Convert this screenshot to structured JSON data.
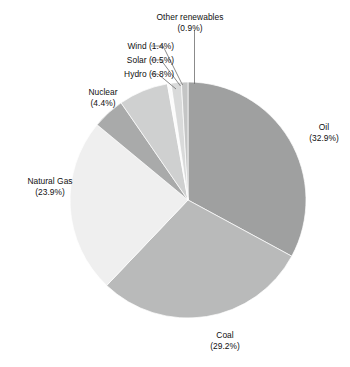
{
  "chart_data": {
    "type": "pie",
    "title": "",
    "subtitle": "",
    "xlabel": "",
    "ylabel": "",
    "legend_position": "none",
    "grid": false,
    "units": "percent",
    "total": 100.0,
    "start_angle_deg": 0,
    "direction": "clockwise",
    "categories": [
      "Oil",
      "Coal",
      "Natural Gas",
      "Nuclear",
      "Hydro",
      "Solar",
      "Wind",
      "Other renewables"
    ],
    "values": [
      32.9,
      29.2,
      23.9,
      4.4,
      6.8,
      0.5,
      1.4,
      0.9
    ],
    "colors": [
      "#9fa0a0",
      "#b9baba",
      "#efefef",
      "#a9aaaa",
      "#cfd0d0",
      "#fbfbfb",
      "#d9dada",
      "#c4c5c5"
    ],
    "slices": [
      {
        "label": "Oil",
        "value": 32.9,
        "value_text": "(32.9%)",
        "color": "#9fa0a0"
      },
      {
        "label": "Coal",
        "value": 29.2,
        "value_text": "(29.2%)",
        "color": "#b9baba"
      },
      {
        "label": "Natural Gas",
        "value": 23.9,
        "value_text": "(23.9%)",
        "color": "#efefef"
      },
      {
        "label": "Nuclear",
        "value": 4.4,
        "value_text": "(4.4%)",
        "color": "#a9aaaa"
      },
      {
        "label": "Hydro",
        "value": 6.8,
        "value_text": "(6.8%)",
        "color": "#cfd0d0"
      },
      {
        "label": "Solar",
        "value": 0.5,
        "value_text": "(0.5%)",
        "color": "#fbfbfb"
      },
      {
        "label": "Wind",
        "value": 1.4,
        "value_text": "(1.4%)",
        "color": "#d9dada"
      },
      {
        "label": "Other renewables",
        "value": 0.9,
        "value_text": "(0.9%)",
        "color": "#c4c5c5"
      }
    ]
  },
  "labels": {
    "other_renewables": {
      "line1": "Other renewables",
      "line2": "(0.9%)"
    },
    "wind": {
      "line1": "Wind (1.4%)"
    },
    "solar": {
      "line1": "Solar (0.5%)"
    },
    "hydro": {
      "line1": "Hydro (6.8%)"
    },
    "nuclear": {
      "line1": "Nuclear",
      "line2": "(4.4%)"
    },
    "natural_gas": {
      "line1": "Natural Gas",
      "line2": "(23.9%)"
    },
    "oil": {
      "line1": "Oil",
      "line2": "(32.9%)"
    },
    "coal": {
      "line1": "Coal",
      "line2": "(29.2%)"
    }
  }
}
